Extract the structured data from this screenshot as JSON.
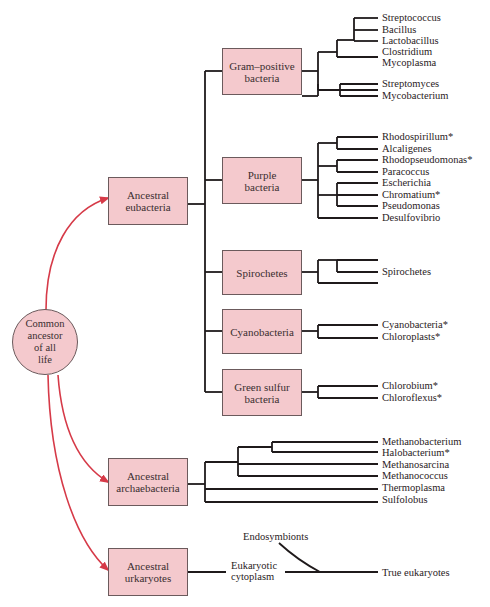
{
  "diagram": {
    "root": {
      "label": "Common ancestor of all life",
      "lines": [
        "Common",
        "ancestor",
        "of all",
        "life"
      ]
    },
    "ancestors": [
      {
        "id": "eubacteria",
        "label": "Ancestral eubacteria",
        "lines": [
          "Ancestral",
          "eubacteria"
        ]
      },
      {
        "id": "archaebacteria",
        "label": "Ancestral archaebacteria",
        "lines": [
          "Ancestral",
          "archaebacteria"
        ]
      },
      {
        "id": "urkaryotes",
        "label": "Ancestral urkaryotes",
        "lines": [
          "Ancestral",
          "urkaryotes"
        ]
      }
    ],
    "eubacteria_groups": [
      {
        "label": "Gram–positive bacteria",
        "lines": [
          "Gram–positive",
          "bacteria"
        ],
        "leaves": [
          "Streptococcus",
          "Bacillus",
          "Lactobacillus",
          "Clostridium",
          "Mycoplasma",
          "Streptomyces",
          "Mycobacterium"
        ]
      },
      {
        "label": "Purple bacteria",
        "lines": [
          "Purple",
          "bacteria"
        ],
        "leaves": [
          "Rhodospirillum*",
          "Alcaligenes",
          "Rhodopseudomonas*",
          "Paracoccus",
          "Escherichia",
          "Chromatium*",
          "Pseudomonas",
          "Desulfovibrio"
        ]
      },
      {
        "label": "Spirochetes",
        "lines": [
          "Spirochetes"
        ],
        "leaves": [
          "Spirochetes"
        ]
      },
      {
        "label": "Cyanobacteria",
        "lines": [
          "Cyanobacteria"
        ],
        "leaves": [
          "Cyanobacteria*",
          "Chloroplasts*"
        ]
      },
      {
        "label": "Green sulfur bacteria",
        "lines": [
          "Green sulfur",
          "bacteria"
        ],
        "leaves": [
          "Chlorobium*",
          "Chloroflexus*"
        ]
      }
    ],
    "archaebacteria_leaves": [
      "Methanobacterium",
      "Halobacterium*",
      "Methanosarcina",
      "Methanococcus",
      "Thermoplasma",
      "Sulfolobus"
    ],
    "eukaryote_branch": {
      "endosymbionts": "Endosymbionts",
      "cytoplasm": [
        "Eukaryotic",
        "cytoplasm"
      ],
      "result": "True eukaryotes"
    },
    "colors": {
      "box_fill": "#f4c9cd",
      "box_border": "#6b5a5c",
      "arrow": "#d63a48",
      "line": "#1f1a1b"
    }
  }
}
